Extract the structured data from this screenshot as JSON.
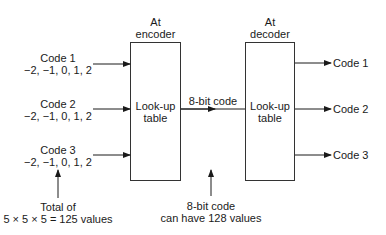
{
  "inputs": [
    {
      "name": "Code 1",
      "values": "−2, −1, 0, 1, 2"
    },
    {
      "name": "Code 2",
      "values": "−2, −1, 0, 1, 2"
    },
    {
      "name": "Code 3",
      "values": "−2, −1, 0, 1, 2"
    }
  ],
  "encoder": {
    "heading_line1": "At",
    "heading_line2": "encoder",
    "body_line1": "Look-up",
    "body_line2": "table"
  },
  "decoder": {
    "heading_line1": "At",
    "heading_line2": "decoder",
    "body_line1": "Look-up",
    "body_line2": "table"
  },
  "link": {
    "label": "8-bit code"
  },
  "outputs": [
    {
      "name": "Code 1"
    },
    {
      "name": "Code 2"
    },
    {
      "name": "Code 3"
    }
  ],
  "annotations": {
    "total_line1": "Total of",
    "total_line2": "5 × 5 × 5 = 125 values",
    "capacity_line1": "8-bit code",
    "capacity_line2": "can have 128 values"
  }
}
